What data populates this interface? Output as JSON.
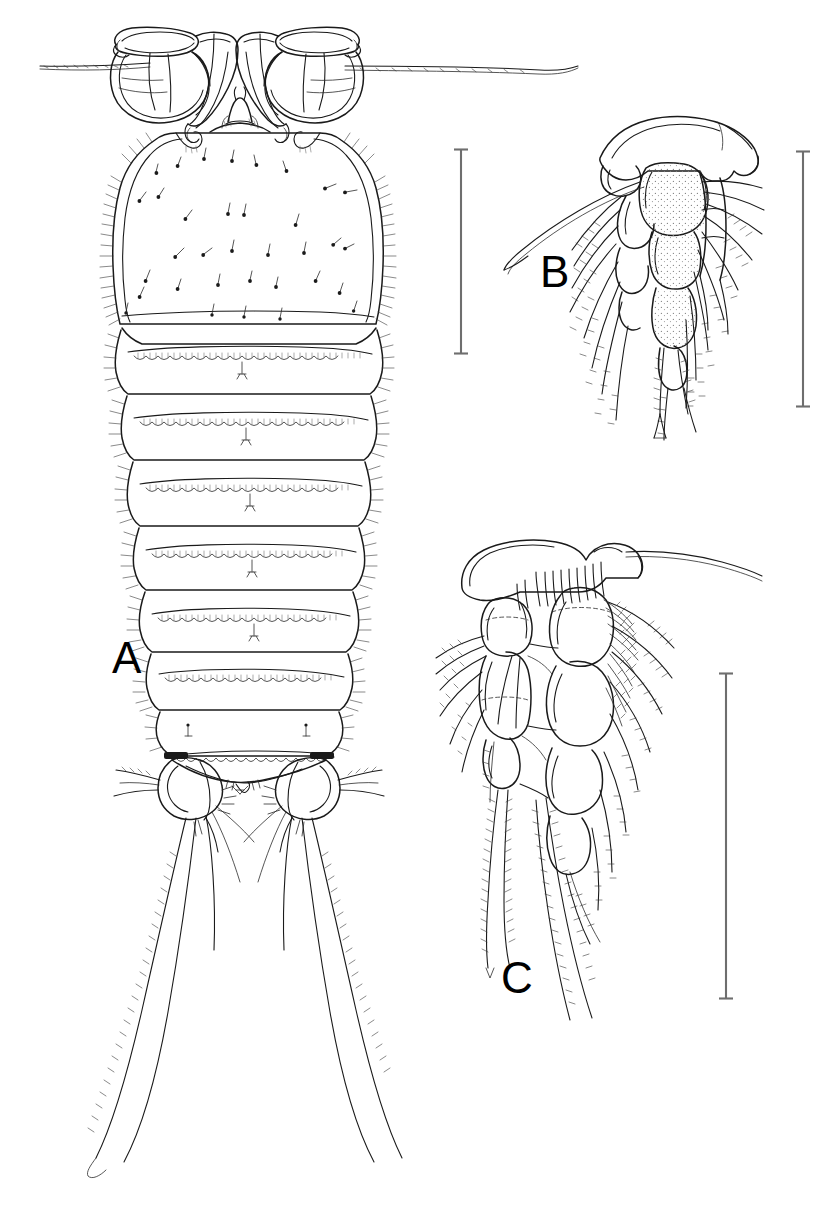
{
  "figure": {
    "kind": "scientific-line-drawing",
    "background_color": "#ffffff",
    "ink_color": "#000000",
    "panel_labels": [
      {
        "id": "A",
        "text": "A",
        "x": 112,
        "y": 636,
        "font_size": 44,
        "describes": "dorsal habitus, whole animal"
      },
      {
        "id": "B",
        "text": "B",
        "x": 540,
        "y": 250,
        "font_size": 44,
        "describes": "appendage, detail"
      },
      {
        "id": "C",
        "text": "C",
        "x": 501,
        "y": 956,
        "font_size": 44,
        "describes": "biramous swimming leg, detail"
      }
    ],
    "scale_bars": [
      {
        "for_panel": "A",
        "x": 461,
        "y_top": 148,
        "y_bottom": 355,
        "length_px": 207,
        "orientation": "vertical",
        "cap": "serif"
      },
      {
        "for_panel": "B",
        "x": 803,
        "y_top": 150,
        "y_bottom": 408,
        "length_px": 258,
        "orientation": "vertical",
        "cap": "serif"
      },
      {
        "for_panel": "C",
        "x": 726,
        "y_top": 672,
        "y_bottom": 1000,
        "length_px": 328,
        "orientation": "vertical",
        "cap": "serif"
      }
    ],
    "clipped_caption_above": "",
    "panel_A": {
      "name": "dorsal-habitus",
      "parts": [
        "antennules",
        "rostrum",
        "cephalothorax",
        "pedigerous somites",
        "urosome",
        "caudal rami",
        "caudal setae"
      ],
      "somite_count": 8
    },
    "panel_B": {
      "name": "appendage-detail",
      "parts": [
        "coxa",
        "basis",
        "exopod",
        "endopod",
        "plumose setae",
        "spines"
      ]
    },
    "panel_C": {
      "name": "swimming-leg-detail",
      "parts": [
        "coxa",
        "basis",
        "exopod segments",
        "endopod segments",
        "plumose setae",
        "outer spines"
      ]
    }
  }
}
